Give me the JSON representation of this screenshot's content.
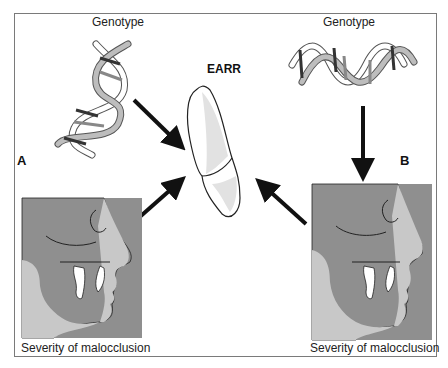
{
  "figure": {
    "title_label": "EARR",
    "panels": [
      {
        "letter": "A",
        "genotype_label": "Genotype",
        "phenotype_label": "Severity of malocclusion"
      },
      {
        "letter": "B",
        "genotype_label": "Genotype",
        "phenotype_label": "Severity of malocclusion"
      }
    ],
    "colors": {
      "skin_light": "#c8c8c8",
      "skin_dark": "#8f8f8f",
      "tooth_shade": "#e2e2e2",
      "arrow": "#111111",
      "frame": "#7a7a7a"
    }
  }
}
